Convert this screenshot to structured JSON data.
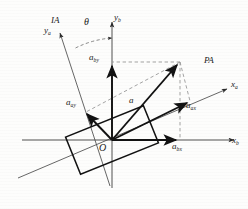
{
  "figure": {
    "type": "vector-decomposition-diagram",
    "background_color": "#fdfdfc",
    "line_color": "#1a1a1a",
    "dash_color": "#8a8a8a",
    "thin_axis_color": "#4a4a4a"
  },
  "labels": {
    "frame_ia": "IA",
    "frame_pa": "PA",
    "axis_ya": "y",
    "axis_ya_sub": "a",
    "axis_yb": "y",
    "axis_yb_sub": "b",
    "axis_xa": "x",
    "axis_xa_sub": "a",
    "axis_xb": "x",
    "axis_xb_sub": "b",
    "angle_theta": "θ",
    "vector_a": "a",
    "comp_aby": "a",
    "comp_aby_sub": "by",
    "comp_abx": "a",
    "comp_abx_sub": "bx",
    "comp_aay": "a",
    "comp_aay_sub": "ay",
    "comp_aax": "a",
    "comp_aax_sub": "ax",
    "origin": "O"
  },
  "geometry": {
    "origin": {
      "x": 112,
      "y": 140
    },
    "rotation_angle_deg": 22,
    "vector_a_tip": {
      "x": 180,
      "y": 62
    },
    "axis_xb_end": {
      "x": 238,
      "y": 140
    },
    "axis_yb_top": {
      "x": 112,
      "y": 18
    },
    "axis_xa_end": {
      "x": 231,
      "y": 86
    },
    "axis_ya_top": {
      "x": 58,
      "y": 30
    },
    "rect_half_length": 42,
    "rect_half_width": 20
  }
}
